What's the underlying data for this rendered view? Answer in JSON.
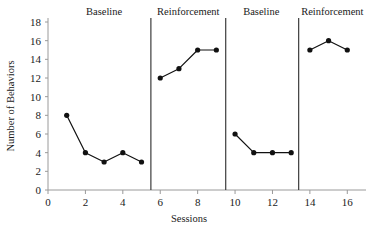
{
  "chart_data": {
    "type": "line",
    "title": "",
    "xlabel": "Sessions",
    "ylabel": "Number of Behaviors",
    "xlim": [
      0,
      17
    ],
    "ylim": [
      0,
      18
    ],
    "xticks": [
      0,
      2,
      4,
      6,
      8,
      10,
      12,
      14,
      16
    ],
    "yticks": [
      0,
      2,
      4,
      6,
      8,
      10,
      12,
      14,
      16,
      18
    ],
    "grid": false,
    "legend": "none",
    "marker": "filled-circle",
    "line_color": "#111111",
    "marker_color": "#111111",
    "axis_color": "#9a9a9a",
    "divider_color": "#3d3d3d",
    "background": "#ffffff",
    "phases": [
      {
        "label": "Baseline",
        "label_x": 3.0,
        "x": [
          1,
          2,
          3,
          4,
          5
        ],
        "values": [
          8,
          4,
          3,
          4,
          3
        ]
      },
      {
        "label": "Reinforcement",
        "label_x": 7.5,
        "x": [
          6,
          7,
          8,
          9
        ],
        "values": [
          12,
          13,
          15,
          15
        ]
      },
      {
        "label": "Baseline",
        "label_x": 11.4,
        "x": [
          10,
          11,
          12,
          13
        ],
        "values": [
          6,
          4,
          4,
          4
        ]
      },
      {
        "label": "Reinforcement",
        "label_x": 15.2,
        "x": [
          14,
          15,
          16
        ],
        "values": [
          15,
          16,
          15
        ]
      }
    ],
    "phase_dividers": [
      5.5,
      9.5,
      13.4
    ],
    "series": [
      {
        "name": "Number of Behaviors",
        "x": [
          1,
          2,
          3,
          4,
          5,
          6,
          7,
          8,
          9,
          10,
          11,
          12,
          13,
          14,
          15,
          16
        ],
        "values": [
          8,
          4,
          3,
          4,
          3,
          12,
          13,
          15,
          15,
          6,
          4,
          4,
          4,
          15,
          16,
          15
        ]
      }
    ]
  }
}
